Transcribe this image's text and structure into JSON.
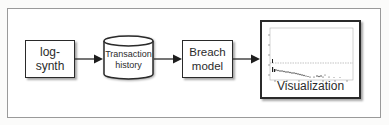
{
  "diagram": {
    "type": "flowchart",
    "direction": "left-to-right",
    "nodes": [
      {
        "id": "log-synth",
        "shape": "rectangle",
        "label": "log-\nsynth"
      },
      {
        "id": "transaction-history",
        "shape": "cylinder",
        "label": "Transaction\nhistory"
      },
      {
        "id": "breach-model",
        "shape": "rectangle",
        "label": "Breach\nmodel"
      },
      {
        "id": "visualization",
        "shape": "rectangle-with-plot",
        "label": "Visualization"
      }
    ],
    "edges": [
      {
        "from": "log-synth",
        "to": "transaction-history"
      },
      {
        "from": "transaction-history",
        "to": "breach-model"
      },
      {
        "from": "breach-model",
        "to": "visualization"
      }
    ]
  },
  "labels": {
    "log_synth": "log-\nsynth",
    "transaction_history": "Transaction\nhistory",
    "breach_model": "Breach\nmodel",
    "visualization": "Visualization"
  },
  "colors": {
    "stroke": "#2a2a2a",
    "text": "#2b2b2b",
    "frame": "#9a9a9a",
    "background": "#ffffff"
  }
}
